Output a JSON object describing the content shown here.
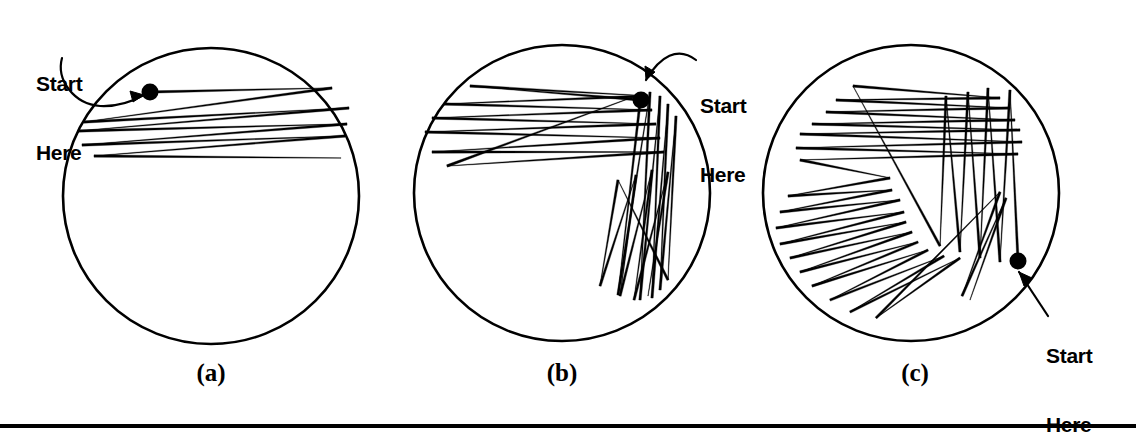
{
  "figure": {
    "kind": "billiard-trajectory-diagram",
    "background_color": "#ffffff",
    "ink_color": "#000000",
    "width": 1136,
    "height": 430,
    "bottom_rule": {
      "y": 424,
      "thickness": 4,
      "color": "#000000"
    }
  },
  "annotations": {
    "start_here_line1": "Start",
    "start_here_line2": "Here"
  },
  "panels": [
    {
      "id": "a",
      "label": "(a)",
      "label_x": 211,
      "label_y": 360,
      "circle": {
        "cx": 211,
        "cy": 196,
        "r": 148,
        "stroke_width": 2.6
      },
      "start_dot": {
        "cx": 150,
        "cy": 92,
        "r": 8.5
      },
      "annotation": {
        "text_x": 36,
        "text_y": 26,
        "arrow_kind": "curved",
        "arrow_path": "M 62 58 C 56 80, 74 104, 100 106 C 120 107, 135 100, 144 95",
        "arrow_tip": "M 144 95 L 130 91 L 133 102 Z"
      },
      "trajectory": {
        "description": "shallow near-horizontal chords, few bounces",
        "bounce_count": 9,
        "points": [
          [
            150,
            92
          ],
          [
            332,
            88
          ],
          [
            84,
            122
          ],
          [
            349,
            108
          ],
          [
            78,
            131
          ],
          [
            347,
            124
          ],
          [
            82,
            145
          ],
          [
            345,
            136
          ],
          [
            94,
            156
          ],
          [
            341,
            158
          ]
        ]
      }
    },
    {
      "id": "b",
      "label": "(b)",
      "label_x": 562,
      "label_y": 360,
      "circle": {
        "cx": 562,
        "cy": 193,
        "r": 148,
        "stroke_width": 2.6
      },
      "start_dot": {
        "cx": 641,
        "cy": 100,
        "r": 8.5
      },
      "annotation": {
        "text_x": 700,
        "text_y": 48,
        "arrow_kind": "curved",
        "arrow_path": "M 696 60 C 678 46, 660 56, 646 80",
        "arrow_tip": "M 646 80 L 645 66 L 655 72 Z"
      },
      "trajectory": {
        "description": "horizontal bundle in upper-left plus steep near-vertical bundle lower-right",
        "bounce_count": 22,
        "points": [
          [
            641,
            100
          ],
          [
            470,
            86
          ],
          [
            648,
            96
          ],
          [
            444,
            104
          ],
          [
            652,
            110
          ],
          [
            432,
            118
          ],
          [
            656,
            124
          ],
          [
            425,
            132
          ],
          [
            660,
            138
          ],
          [
            432,
            152
          ],
          [
            664,
            152
          ],
          [
            447,
            166
          ],
          [
            641,
            94
          ],
          [
            618,
            295
          ],
          [
            650,
            92
          ],
          [
            640,
            300
          ],
          [
            660,
            96
          ],
          [
            652,
            298
          ],
          [
            668,
            104
          ],
          [
            660,
            290
          ],
          [
            676,
            116
          ],
          [
            668,
            280
          ],
          [
            618,
            180
          ],
          [
            600,
            286
          ],
          [
            636,
            175
          ],
          [
            620,
            296
          ],
          [
            652,
            170
          ],
          [
            634,
            300
          ],
          [
            668,
            172
          ],
          [
            648,
            296
          ]
        ]
      }
    },
    {
      "id": "c",
      "label": "(c)",
      "label_x": 915,
      "label_y": 360,
      "circle": {
        "cx": 911,
        "cy": 193,
        "r": 148,
        "stroke_width": 2.6
      },
      "start_dot": {
        "cx": 1018,
        "cy": 261,
        "r": 8.5
      },
      "annotation": {
        "text_x": 1046,
        "text_y": 298,
        "arrow_kind": "straight",
        "arrow_path": "M 1048 316 L 1019 272",
        "arrow_tip": "M 1019 272 L 1024 286 L 1032 278 Z"
      },
      "trajectory": {
        "description": "dense ergodic filling: horizontal bundle top, zigzag lower-left, steep bundle right",
        "bounce_count": 45,
        "points": [
          [
            1018,
            261
          ],
          [
            1010,
            90
          ],
          [
            1000,
            262
          ],
          [
            988,
            88
          ],
          [
            980,
            258
          ],
          [
            968,
            92
          ],
          [
            960,
            252
          ],
          [
            946,
            96
          ],
          [
            940,
            246
          ],
          [
            853,
            86
          ],
          [
            1000,
            98
          ],
          [
            836,
            100
          ],
          [
            1010,
            108
          ],
          [
            826,
            112
          ],
          [
            1015,
            120
          ],
          [
            812,
            124
          ],
          [
            1020,
            130
          ],
          [
            800,
            134
          ],
          [
            1022,
            142
          ],
          [
            796,
            148
          ],
          [
            1018,
            154
          ],
          [
            800,
            160
          ],
          [
            890,
            178
          ],
          [
            788,
            196
          ],
          [
            892,
            190
          ],
          [
            780,
            212
          ],
          [
            900,
            200
          ],
          [
            776,
            228
          ],
          [
            904,
            212
          ],
          [
            780,
            244
          ],
          [
            906,
            222
          ],
          [
            790,
            258
          ],
          [
            912,
            232
          ],
          [
            800,
            272
          ],
          [
            918,
            242
          ],
          [
            812,
            286
          ],
          [
            928,
            250
          ],
          [
            830,
            300
          ],
          [
            944,
            256
          ],
          [
            850,
            312
          ],
          [
            960,
            258
          ],
          [
            876,
            318
          ],
          [
            1000,
            192
          ],
          [
            962,
            296
          ],
          [
            1006,
            198
          ],
          [
            970,
            300
          ]
        ]
      }
    }
  ]
}
